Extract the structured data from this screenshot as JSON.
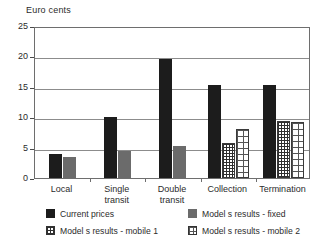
{
  "chart_data": {
    "type": "bar",
    "title": "",
    "ylabel": "Euro cents",
    "xlabel": "",
    "ylim": [
      0,
      25
    ],
    "yticks": [
      0,
      5,
      10,
      15,
      20,
      25
    ],
    "grid": true,
    "legend_position": "bottom",
    "categories": [
      "Local",
      "Single\ntransit",
      "Double\ntransit",
      "Collection",
      "Termination"
    ],
    "series": [
      {
        "name": "Current prices",
        "key": "current",
        "color": "#1c1c1c",
        "pattern": "solid",
        "values": [
          4.0,
          10.0,
          19.5,
          15.3,
          15.3
        ]
      },
      {
        "name": "Model s results - fixed",
        "key": "fixed",
        "color": "#6b6b6b",
        "pattern": "solid",
        "values": [
          3.5,
          4.5,
          5.2,
          null,
          null
        ]
      },
      {
        "name": "Model s results - mobile 1",
        "key": "mobile1",
        "color": "#ffffff",
        "pattern": "fine-grid",
        "values": [
          null,
          null,
          null,
          5.7,
          9.3
        ]
      },
      {
        "name": "Model s results - mobile 2",
        "key": "mobile2",
        "color": "#ffffff",
        "pattern": "coarse-grid",
        "values": [
          null,
          null,
          null,
          8.0,
          9.2
        ]
      }
    ]
  },
  "legend": {
    "items": [
      {
        "label": "Current prices",
        "key": "current"
      },
      {
        "label": "Model s results - fixed",
        "key": "fixed"
      },
      {
        "label": "Model s results - mobile 1",
        "key": "mobile1"
      },
      {
        "label": "Model s results - mobile 2",
        "key": "mobile2"
      }
    ]
  }
}
